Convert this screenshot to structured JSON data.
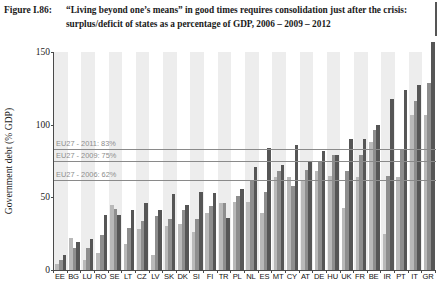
{
  "caption": {
    "label": "Figure I.86:",
    "line1": "“Living beyond one’s means” in good times requires consolidation just after the crisis:",
    "line2": "surplus/deficit of states as a percentage of GDP, 2006 – 2009 – 2012"
  },
  "colors": {
    "bar_2006": "#b9b9b9",
    "bar_2009": "#8e8e8e",
    "bar_2012": "#565656",
    "band": "#ededed",
    "axis": "#4a4a4a",
    "annotation": "#8d8d8d"
  },
  "annotations": [
    {
      "name": "eu27-2011",
      "text": "EU27 - 2011: 83%",
      "value": 83
    },
    {
      "name": "eu27-2009",
      "text": "EU27 - 2009: 75%",
      "value": 75
    },
    {
      "name": "eu27-2006",
      "text": "EU27 - 2006: 62%",
      "value": 62
    }
  ],
  "chart_data": {
    "type": "bar",
    "title": "“Living beyond one’s means” in good times requires consolidation just after the crisis: surplus/deficit of states as a percentage of GDP, 2006 – 2009 – 2012",
    "xlabel": "",
    "ylabel": "Government debt (% GDP)",
    "ylim": [
      0,
      150
    ],
    "yticks": [
      0,
      50,
      100,
      150
    ],
    "ytick_labels": [
      "0",
      "50",
      "100",
      "150"
    ],
    "grid": false,
    "legend_position": "none",
    "categories": [
      "EE",
      "BG",
      "LU",
      "RO",
      "SE",
      "LT",
      "CZ",
      "LV",
      "SK",
      "DK",
      "SI",
      "FI",
      "TR",
      "PL",
      "NL",
      "ES",
      "MT",
      "CY",
      "AT",
      "DE",
      "HU",
      "UK",
      "FR",
      "BE",
      "IR",
      "PT",
      "IT",
      "GR"
    ],
    "series": [
      {
        "name": "2006",
        "color": "#b9b9b9",
        "values": [
          4,
          22,
          7,
          12,
          45,
          18,
          28,
          10,
          30,
          32,
          26,
          39,
          46,
          47,
          47,
          39,
          64,
          64,
          62,
          68,
          65,
          43,
          64,
          88,
          25,
          64,
          107,
          107
        ]
      },
      {
        "name": "2009",
        "color": "#8e8e8e",
        "values": [
          7,
          15,
          15,
          24,
          42,
          29,
          34,
          37,
          35,
          41,
          35,
          44,
          46,
          51,
          61,
          54,
          68,
          58,
          69,
          74,
          79,
          68,
          79,
          96,
          65,
          83,
          116,
          129
        ]
      },
      {
        "name": "2012",
        "color": "#565656",
        "values": [
          10,
          19,
          21,
          38,
          38,
          41,
          46,
          41,
          52,
          45,
          54,
          53,
          36,
          56,
          71,
          84,
          72,
          86,
          74,
          82,
          79,
          90,
          90,
          100,
          118,
          124,
          127,
          157
        ]
      }
    ]
  }
}
